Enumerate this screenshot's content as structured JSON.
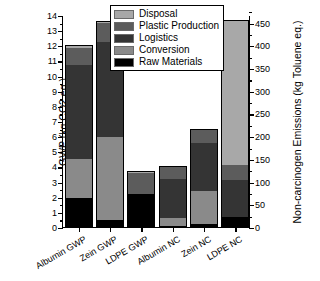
{
  "chart_data": {
    "type": "bar",
    "subtype": "stacked-bar-dual-axis",
    "title": "",
    "xlabel": "",
    "ylabel": "GWP (kg CO2 eq.)",
    "y2label": "Non-carcinogen Emissions (kg Toluene eq.)",
    "ylim": [
      0,
      14
    ],
    "y2lim": [
      0,
      466.7
    ],
    "yticks": [
      0,
      1,
      2,
      3,
      4,
      5,
      6,
      7,
      8,
      9,
      10,
      11,
      12,
      13,
      14
    ],
    "y2ticks": [
      0,
      50,
      100,
      150,
      200,
      250,
      300,
      350,
      400,
      450
    ],
    "grid": false,
    "legend_position": "top-center",
    "categories": [
      "Albumin GWP",
      "Zein GWP",
      "LDPE GWP",
      "Albumin NC",
      "Zein NC",
      "LDPE NC"
    ],
    "category_axis": [
      "left",
      "left",
      "left",
      "right",
      "right",
      "right"
    ],
    "series": [
      {
        "name": "Raw Materials",
        "color": "#000000",
        "values": [
          1.9,
          0.45,
          2.2,
          0.05,
          0.2,
          0.65
        ]
      },
      {
        "name": "Conversion",
        "color": "#8a8a8a",
        "values": [
          2.6,
          5.5,
          0.0,
          0.55,
          2.2,
          0.0
        ]
      },
      {
        "name": "Logistics",
        "color": "#343434",
        "values": [
          6.2,
          6.3,
          0.0,
          2.55,
          3.15,
          2.45
        ]
      },
      {
        "name": "Plastic Production",
        "color": "#5c5c5c",
        "values": [
          1.15,
          1.2,
          1.35,
          0.9,
          0.95,
          1.0
        ]
      },
      {
        "name": "Disposal",
        "color": "#a8a8a8",
        "values": [
          0.15,
          0.15,
          0.15,
          0.0,
          0.0,
          9.55
        ]
      }
    ],
    "totals": [
      12.0,
      13.6,
      3.7,
      4.05,
      6.5,
      13.65
    ],
    "totals_right_axis_units": [
      null,
      null,
      null,
      135.0,
      216.7,
      455.0
    ],
    "legend_entries": [
      "Disposal",
      "Plastic Production",
      "Logistics",
      "Conversion",
      "Raw Materials"
    ],
    "annotations": []
  }
}
